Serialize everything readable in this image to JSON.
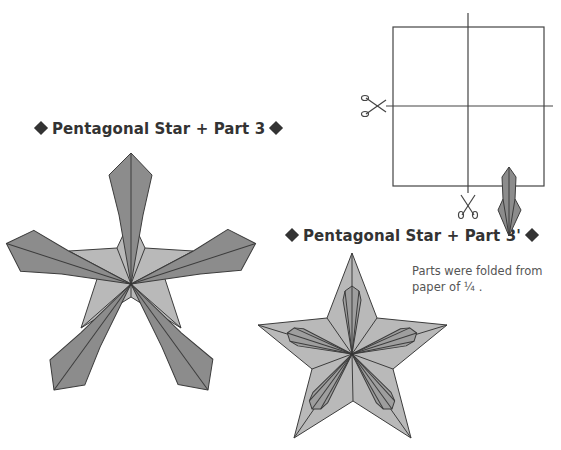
{
  "diagram": {
    "left_title": {
      "text": "Pentagonal Star + Part 3",
      "marker": "diamond-icon"
    },
    "right_title": {
      "text": "Pentagonal Star + Part 3'",
      "marker": "diamond-icon"
    },
    "note": {
      "line1": "Parts were folded from",
      "line2": "paper of ¼ ."
    },
    "cut_diagram": {
      "description": "Square paper cut into quarters",
      "cuts": [
        "horizontal",
        "vertical"
      ],
      "icons": [
        "scissors-icon",
        "scissors-icon"
      ]
    },
    "colors": {
      "dark_fill": "#8c8c8c",
      "light_fill": "#b9b9b9",
      "stroke": "#3c3c3c",
      "text": "#333333"
    }
  }
}
